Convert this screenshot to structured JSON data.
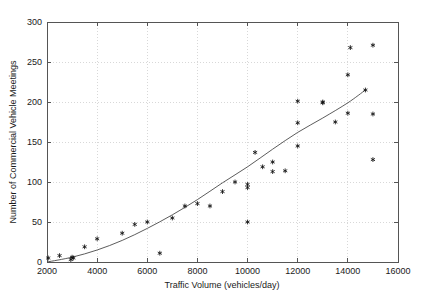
{
  "chart_data": {
    "type": "scatter",
    "title": "",
    "xlabel": "Traffic Volume (vehicles/day)",
    "ylabel": "Number of Commercial Vehicle Meetings",
    "xlim": [
      2000,
      16000
    ],
    "ylim": [
      0,
      300
    ],
    "xticks": [
      2000,
      4000,
      6000,
      8000,
      10000,
      12000,
      14000,
      16000
    ],
    "yticks": [
      0,
      50,
      100,
      150,
      200,
      250,
      300
    ],
    "xtick_labels": [
      "2000",
      "4000",
      "6000",
      "8000",
      "10000",
      "12000",
      "14000",
      "16000"
    ],
    "ytick_labels": [
      "0",
      "50",
      "100",
      "150",
      "200",
      "250",
      "300"
    ],
    "grid": true,
    "legend": "none",
    "marker_style": "asterisk",
    "marker_color": "#111111",
    "series": [
      {
        "name": "Observed meetings",
        "type": "scatter",
        "points": [
          [
            2050,
            5
          ],
          [
            2500,
            8
          ],
          [
            2950,
            3
          ],
          [
            3000,
            6
          ],
          [
            3050,
            5
          ],
          [
            3500,
            19
          ],
          [
            4000,
            29
          ],
          [
            5000,
            36
          ],
          [
            5500,
            47
          ],
          [
            6000,
            50
          ],
          [
            6500,
            11
          ],
          [
            7000,
            55
          ],
          [
            7500,
            70
          ],
          [
            8000,
            73
          ],
          [
            8500,
            70
          ],
          [
            9000,
            88
          ],
          [
            9500,
            100
          ],
          [
            10000,
            93
          ],
          [
            10000,
            97
          ],
          [
            10000,
            50
          ],
          [
            10300,
            137
          ],
          [
            10600,
            119
          ],
          [
            11000,
            113
          ],
          [
            11000,
            125
          ],
          [
            11500,
            114
          ],
          [
            12000,
            174
          ],
          [
            12000,
            201
          ],
          [
            12000,
            145
          ],
          [
            13000,
            200
          ],
          [
            13000,
            199
          ],
          [
            13500,
            175
          ],
          [
            14000,
            234
          ],
          [
            14000,
            186
          ],
          [
            14100,
            268
          ],
          [
            14700,
            215
          ],
          [
            15000,
            271
          ],
          [
            15000,
            185
          ],
          [
            15000,
            128
          ]
        ]
      },
      {
        "name": "Fitted trend",
        "type": "line",
        "color": "#4a4a4a",
        "points": [
          [
            2000,
            0
          ],
          [
            3000,
            6
          ],
          [
            4000,
            15
          ],
          [
            5000,
            27
          ],
          [
            6000,
            42
          ],
          [
            7000,
            59
          ],
          [
            8000,
            78
          ],
          [
            9000,
            99
          ],
          [
            10000,
            119
          ],
          [
            11000,
            141
          ],
          [
            12000,
            162
          ],
          [
            13000,
            180
          ],
          [
            14000,
            199
          ],
          [
            14700,
            215
          ]
        ]
      }
    ]
  },
  "figure": {
    "background_color": "#ffffff",
    "axis_color": "#555555",
    "grid_color": "#c8c8c8"
  }
}
